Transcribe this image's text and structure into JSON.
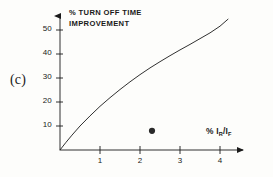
{
  "figure": {
    "panel_label": "(c)",
    "background_color": "#fdfdfb",
    "ink_color": "#1a1a1a"
  },
  "chart_data": {
    "type": "line",
    "title": "",
    "ylabel": "% TURN OFF TIME IMPROVEMENT",
    "ylabel_line1": "% TURN OFF TIME",
    "ylabel_line2": "IMPROVEMENT",
    "xlabel": "% I",
    "xlabel_sub1": "R",
    "xlabel_mid": "/I",
    "xlabel_sub2": "F",
    "xlim": [
      0,
      4.6
    ],
    "ylim": [
      0,
      58
    ],
    "grid": false,
    "legend": "none",
    "xticks": [
      1,
      2,
      3,
      4
    ],
    "xtick_labels": [
      "1",
      "2",
      "3",
      "4"
    ],
    "yticks": [
      10,
      20,
      30,
      40,
      50
    ],
    "ytick_labels": [
      "10",
      "20",
      "30",
      "40",
      "50"
    ],
    "series": [
      {
        "name": "turn off time improvement curve",
        "style": "solid-line",
        "x": [
          0,
          0.15,
          0.3,
          0.5,
          0.75,
          1.0,
          1.25,
          1.5,
          1.75,
          2.0,
          2.25,
          2.5,
          2.75,
          3.0,
          3.25,
          3.5,
          3.75,
          4.0,
          4.2
        ],
        "y": [
          0,
          3.2,
          6.2,
          10.0,
          14.2,
          18.2,
          21.8,
          25.2,
          28.4,
          31.4,
          34.2,
          36.8,
          39.3,
          41.7,
          44.0,
          46.4,
          48.8,
          51.6,
          54.5
        ]
      },
      {
        "name": "measured data point",
        "style": "filled-circle-marker",
        "x": [
          2.3
        ],
        "y": [
          8.0
        ]
      }
    ]
  }
}
